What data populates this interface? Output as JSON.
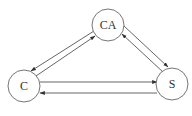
{
  "diagram": {
    "type": "directed-graph",
    "colors": {
      "stroke": "#555555",
      "node_border": "#666666",
      "text": "#333333",
      "background": "#ffffff"
    },
    "nodes": [
      {
        "id": "CA",
        "label": "CA",
        "cx": 108,
        "cy": 25,
        "r": 16
      },
      {
        "id": "C",
        "label": "C",
        "cx": 24,
        "cy": 85,
        "r": 16
      },
      {
        "id": "S",
        "label": "S",
        "cx": 172,
        "cy": 83,
        "r": 16
      }
    ],
    "edges": [
      {
        "from": "CA",
        "to": "C",
        "label": ""
      },
      {
        "from": "C",
        "to": "CA",
        "label": ""
      },
      {
        "from": "CA",
        "to": "S",
        "label": ""
      },
      {
        "from": "S",
        "to": "CA",
        "label": ""
      },
      {
        "from": "C",
        "to": "S",
        "label": ""
      },
      {
        "from": "S",
        "to": "C",
        "label": ""
      }
    ]
  }
}
